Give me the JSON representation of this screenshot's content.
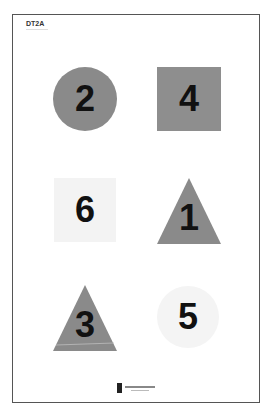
{
  "page": {
    "title": "DT2A",
    "subtitle": ""
  },
  "targets": [
    {
      "number": "2",
      "shape": "circle",
      "color": "#8a8a8a"
    },
    {
      "number": "4",
      "shape": "square",
      "color": "#8e8e8e"
    },
    {
      "number": "6",
      "shape": "square",
      "color": "#f3f3f3"
    },
    {
      "number": "1",
      "shape": "triangle",
      "color": "#8a8a8a"
    },
    {
      "number": "3",
      "shape": "triangle",
      "color": "#8a8a8a"
    },
    {
      "number": "5",
      "shape": "circle",
      "color": "#f4f4f4"
    }
  ],
  "footer": {
    "logo_icon": "lighthouse-logo-icon"
  }
}
